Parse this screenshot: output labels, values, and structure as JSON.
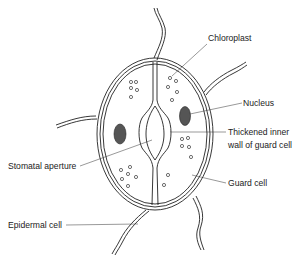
{
  "diagram": {
    "labels": {
      "chloroplast": "Chloroplast",
      "nucleus": "Nucleus",
      "thickened_line1": "Thickened inner",
      "thickened_line2": "wall of guard cell",
      "stomatal_aperture": "Stomatal aperture",
      "guard_cell": "Guard cell",
      "epidermal_cell": "Epidermal cell"
    },
    "colors": {
      "line": "#222222",
      "background": "#ffffff",
      "nucleus_fill": "#555555"
    }
  }
}
